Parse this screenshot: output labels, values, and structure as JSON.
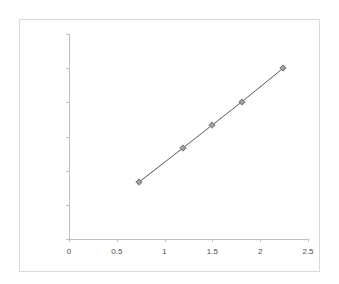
{
  "chart_data": {
    "type": "line",
    "title": "",
    "subtitle": "",
    "xlabel": "",
    "ylabel": "",
    "xlim": [
      0,
      2.5
    ],
    "ylim": [
      0,
      300000
    ],
    "grid": false,
    "legend": "none",
    "x_ticks": [
      "0",
      "0.5",
      "1",
      "1.5",
      "2",
      "2.5"
    ],
    "x_tick_values": [
      0,
      0.5,
      1,
      1.5,
      2,
      2.5
    ],
    "y_ticks": [
      "0",
      "50000",
      "100000",
      "150000",
      "200000",
      "250000",
      "300000"
    ],
    "y_tick_values": [
      0,
      50000,
      100000,
      150000,
      200000,
      250000,
      300000
    ],
    "series": [
      {
        "name": "",
        "marker": "diamond",
        "marker_color": "#a6a6a6",
        "line_color": "#595959",
        "points": [
          {
            "x": 0.73,
            "y": 83000
          },
          {
            "x": 1.19,
            "y": 133000
          },
          {
            "x": 1.5,
            "y": 167000
          },
          {
            "x": 1.81,
            "y": 201000
          },
          {
            "x": 2.24,
            "y": 250000
          }
        ],
        "x": [
          0.73,
          1.19,
          1.5,
          1.81,
          2.24
        ],
        "values": [
          83000,
          133000,
          167000,
          201000,
          250000
        ]
      }
    ]
  },
  "colors": {
    "axis_line": "#bfbfbf",
    "tick_label": "#4a4a4a",
    "frame_border": "#d9d9d9",
    "plot_background": "#ffffff",
    "series_line": "#595959",
    "marker_fill": "#a6a6a6",
    "marker_stroke": "#7f7f7f"
  }
}
